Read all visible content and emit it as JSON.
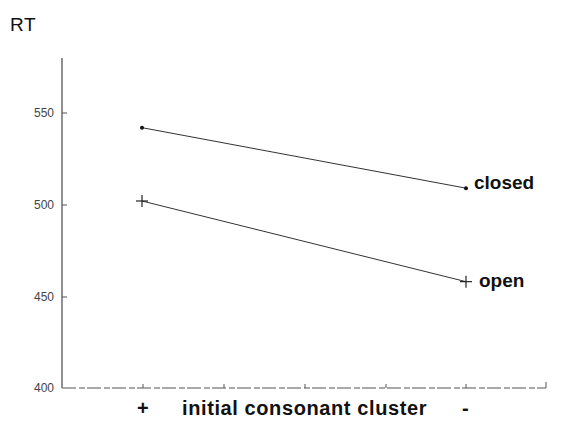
{
  "chart_data": {
    "type": "line",
    "title": "",
    "ylabel": "RT",
    "xlabel": "initial consonant cluster",
    "categories": [
      "+",
      "-"
    ],
    "series": [
      {
        "name": "closed",
        "marker": "dot",
        "values": [
          542,
          509
        ]
      },
      {
        "name": "open",
        "marker": "plus",
        "values": [
          502,
          458
        ]
      }
    ],
    "yticks": [
      400,
      450,
      500,
      550
    ],
    "ylim": [
      400,
      580
    ],
    "grid": false,
    "legend": "direct labels at line ends (right)"
  },
  "labels": {
    "y_axis": "RT",
    "x_axis": "initial consonant cluster",
    "x_plus": "+",
    "x_minus": "-",
    "ytick_400": "400",
    "ytick_450": "450",
    "ytick_500": "500",
    "ytick_550": "550",
    "series_closed": "closed",
    "series_open": "open"
  },
  "colors": {
    "axis": "#555555",
    "line": "#333333",
    "text": "#111111"
  }
}
